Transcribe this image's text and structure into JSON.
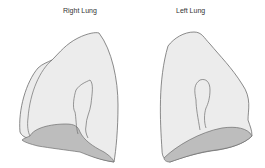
{
  "labels": {
    "right_lung": "Right Lung",
    "left_lung": "Left Lung"
  },
  "colors": {
    "lung_fill": "#ececec",
    "base_fill": "#bdbdbd",
    "outline": "#6e6e6e",
    "text": "#333333"
  }
}
